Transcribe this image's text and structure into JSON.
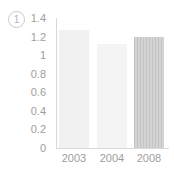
{
  "marker": {
    "label": "1",
    "glyph": "①"
  },
  "chart_data": {
    "type": "bar",
    "title": "",
    "subtitle": "",
    "xlabel": "",
    "ylabel": "",
    "categories": [
      "2003",
      "2004",
      "2008"
    ],
    "values": [
      1.27,
      1.12,
      1.2
    ],
    "series": [
      {
        "name": "1",
        "values": [
          1.27,
          1.12,
          1.2
        ]
      }
    ],
    "ylim": [
      0,
      1.4
    ],
    "ytick_labels": [
      "1.4",
      "1.2",
      "1",
      "0.8",
      "0.6",
      "0.4",
      "0.2",
      "0"
    ],
    "ytick_values": [
      1.4,
      1.2,
      1.0,
      0.8,
      0.6,
      0.4,
      0.2,
      0
    ],
    "grid": false,
    "legend": "none",
    "bar_colors": [
      "#f1f1f1",
      "#f4f4f4",
      "#cccccc"
    ],
    "bar_styles": [
      "solid",
      "solid",
      "hatched"
    ],
    "axis_color": "#d8d8d8",
    "tick_label_color": "#9e9e9e"
  }
}
